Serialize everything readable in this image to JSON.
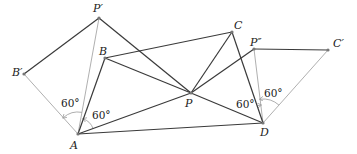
{
  "diagram": {
    "title": "",
    "colors": {
      "dark_line": "#3a3a3a",
      "light_line": "#b0b0b0",
      "point": "#777777",
      "text": "#222222"
    },
    "points": [
      {
        "id": "Pp",
        "label": "P′",
        "x": 99,
        "y": 18,
        "lx": 93,
        "ly": 12
      },
      {
        "id": "Bp",
        "label": "B′",
        "x": 24,
        "y": 74,
        "lx": 12,
        "ly": 76
      },
      {
        "id": "B",
        "label": "B",
        "x": 105,
        "y": 58,
        "lx": 99,
        "ly": 55
      },
      {
        "id": "A",
        "label": "A",
        "x": 78,
        "y": 134,
        "lx": 70,
        "ly": 149
      },
      {
        "id": "C",
        "label": "C",
        "x": 232,
        "y": 32,
        "lx": 234,
        "ly": 29
      },
      {
        "id": "P",
        "label": "P",
        "x": 191,
        "y": 93,
        "lx": 185,
        "ly": 107
      },
      {
        "id": "Ppp",
        "label": "P″",
        "x": 254,
        "y": 49,
        "lx": 250,
        "ly": 46
      },
      {
        "id": "Cp",
        "label": "C′",
        "x": 328,
        "y": 50,
        "lx": 333,
        "ly": 47
      },
      {
        "id": "D",
        "label": "D",
        "x": 263,
        "y": 123,
        "lx": 260,
        "ly": 136
      }
    ],
    "segments_dark": [
      [
        "Bp",
        "Pp"
      ],
      [
        "Pp",
        "P"
      ],
      [
        "B",
        "C"
      ],
      [
        "B",
        "P"
      ],
      [
        "B",
        "A"
      ],
      [
        "A",
        "P"
      ],
      [
        "A",
        "D"
      ],
      [
        "C",
        "P"
      ],
      [
        "C",
        "D"
      ],
      [
        "P",
        "D"
      ],
      [
        "P",
        "Ppp"
      ],
      [
        "Ppp",
        "Cp"
      ]
    ],
    "segments_light": [
      [
        "Bp",
        "A"
      ],
      [
        "A",
        "Pp"
      ],
      [
        "Ppp",
        "D"
      ],
      [
        "D",
        "Cp"
      ]
    ],
    "angles": [
      {
        "label": "60°",
        "vertex": "A",
        "from": "Pp",
        "to": "Bp",
        "tx": 61,
        "ty": 107,
        "r": 22
      },
      {
        "label": "60°",
        "vertex": "A",
        "from": "P",
        "to": "B",
        "tx": 92,
        "ty": 119,
        "r": 16
      },
      {
        "label": "60°",
        "vertex": "D",
        "from": "C",
        "to": "Ppp",
        "tx": 236,
        "ty": 108,
        "r": 18
      },
      {
        "label": "60°",
        "vertex": "D",
        "from": "Cp",
        "to": "Ppp",
        "tx": 264,
        "ty": 97,
        "r": 24
      }
    ]
  }
}
